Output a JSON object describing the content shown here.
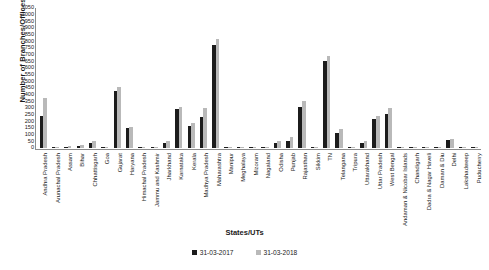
{
  "chart_data": {
    "type": "bar",
    "title": "",
    "xlabel": "States/UTs",
    "ylabel": "Number of Branches/Offices",
    "ylim": [
      0,
      1050
    ],
    "ytick_step": 50,
    "yticks": [
      1050,
      1000,
      950,
      900,
      850,
      800,
      750,
      700,
      650,
      600,
      550,
      500,
      450,
      400,
      350,
      300,
      250,
      200,
      150,
      100,
      50,
      0
    ],
    "grid": false,
    "legend_position": "bottom",
    "colors": {
      "series_0": "#1c1c1c",
      "series_1": "#b9b9b9"
    },
    "categories": [
      "Andhra Pradesh",
      "Arunachal Pradesh",
      "Assam",
      "Bihar",
      "Chhattisgarh",
      "Goa",
      "Gujarat",
      "Haryana",
      "Himachal Pradesh",
      "Jammu and Kashmir",
      "Jharkhand",
      "Karnataka",
      "Kerala",
      "Madhya Pradesh",
      "Maharashtra",
      "Manipur",
      "Meghalaya",
      "Mizoram",
      "Nagaland",
      "Odisha",
      "Punjab",
      "Rajasthan",
      "Sikkim",
      "TN",
      "Telangana",
      "Tripura",
      "Uttarakhand",
      "Uttar Pradesh",
      "West Bengal",
      "Andaman & Nicobar Islands",
      "Chandigarh",
      "Dadra & Nagar Haveli",
      "Daman & Diu",
      "Delhi",
      "Lakshadweep",
      "Puducherry"
    ],
    "series": [
      {
        "name": "31-03-2017",
        "values": [
          240,
          8,
          10,
          12,
          35,
          8,
          430,
          150,
          5,
          6,
          35,
          295,
          165,
          230,
          770,
          6,
          5,
          4,
          5,
          40,
          55,
          310,
          5,
          650,
          110,
          8,
          40,
          215,
          255,
          4,
          5,
          4,
          3,
          60,
          2,
          5
        ]
      },
      {
        "name": "31-03-2018",
        "values": [
          375,
          10,
          14,
          20,
          55,
          10,
          460,
          155,
          8,
          8,
          50,
          310,
          185,
          300,
          820,
          8,
          6,
          5,
          6,
          55,
          80,
          350,
          6,
          690,
          140,
          10,
          55,
          240,
          300,
          5,
          6,
          5,
          4,
          70,
          3,
          6
        ]
      }
    ]
  },
  "legend": {
    "entries": [
      {
        "label": "31-03-2017"
      },
      {
        "label": "31-03-2018"
      }
    ]
  }
}
